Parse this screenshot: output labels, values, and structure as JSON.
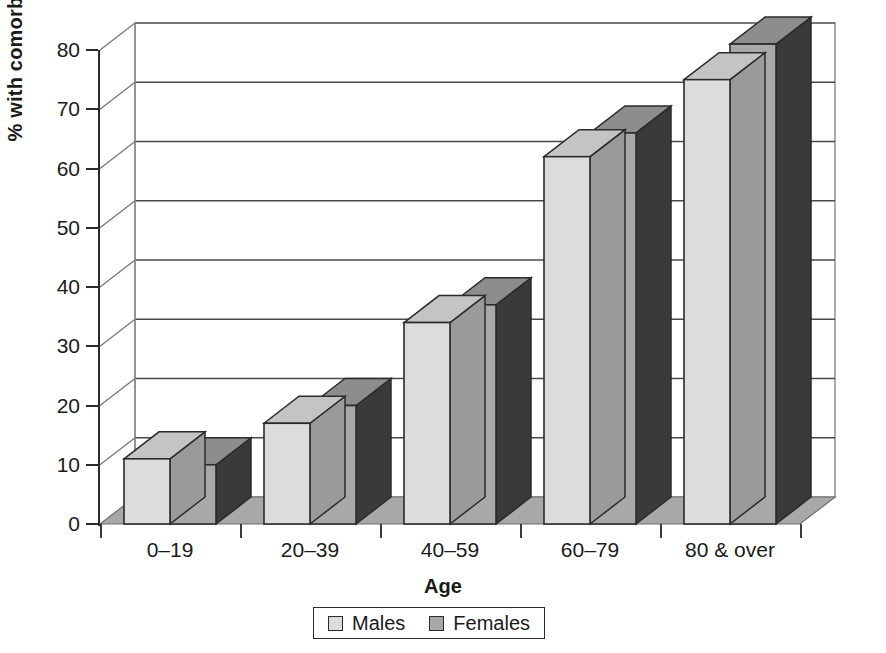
{
  "chart_data": {
    "type": "bar",
    "title": "",
    "subtitle": "",
    "xlabel": "Age",
    "ylabel": "% with comorbidity",
    "categories": [
      "0–19",
      "20–39",
      "40–59",
      "60–79",
      "80 & over"
    ],
    "series": [
      {
        "name": "Males",
        "values": [
          11,
          17,
          34,
          62,
          75
        ],
        "color": "#dcdcdc"
      },
      {
        "name": "Females",
        "values": [
          10,
          20,
          37,
          66,
          81
        ],
        "color": "#a8a8a8"
      }
    ],
    "ylim": [
      0,
      80
    ],
    "yticks": [
      0,
      10,
      20,
      30,
      40,
      50,
      60,
      70,
      80
    ],
    "ytick_labels": [
      "0",
      "10",
      "20",
      "30",
      "40",
      "50",
      "60",
      "70",
      "80"
    ],
    "grid": true,
    "grid_axis": "y",
    "legend_position": "bottom",
    "style": "3d-perspective-grayscale",
    "units": "percent"
  },
  "axes": {
    "y_title": "% with comorbidity",
    "x_title": "Age"
  },
  "legend": {
    "items": [
      {
        "label": "Males",
        "swatch": "#dcdcdc"
      },
      {
        "label": "Females",
        "swatch": "#a8a8a8"
      }
    ]
  },
  "colors": {
    "males_front": "#dcdcdc",
    "males_top": "#c4c4c4",
    "males_side": "#9a9a9a",
    "females_front": "#a8a8a8",
    "females_top": "#8d8d8d",
    "females_side": "#3a3a3a",
    "floor": "#a8a8a8",
    "wall": "#ffffff",
    "gridline": "#4a4a4a",
    "outline": "#2b2b2b",
    "text": "#1a1a1a"
  }
}
